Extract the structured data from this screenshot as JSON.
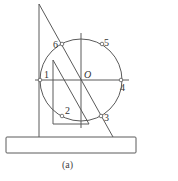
{
  "diagram": {
    "caption": "(a)",
    "center_label": "O",
    "points": [
      {
        "label": "1",
        "x": 40,
        "y": 80,
        "lx": 44,
        "ly": 78
      },
      {
        "label": "2",
        "x": 62,
        "y": 116,
        "lx": 65,
        "ly": 114
      },
      {
        "label": "3",
        "x": 101,
        "y": 116,
        "lx": 104,
        "ly": 121
      },
      {
        "label": "4",
        "x": 121,
        "y": 80,
        "lx": 120,
        "ly": 91
      },
      {
        "label": "5",
        "x": 102,
        "y": 44,
        "lx": 104,
        "ly": 46
      },
      {
        "label": "6",
        "x": 62,
        "y": 44,
        "lx": 53,
        "ly": 48
      }
    ],
    "colors": {
      "stroke": "#5a5a5a",
      "text": "#333333",
      "background": "#ffffff"
    }
  }
}
